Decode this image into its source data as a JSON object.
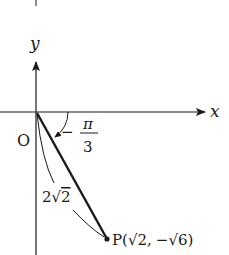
{
  "diagram": {
    "type": "coordinate-plane",
    "axes": {
      "x_label": "x",
      "y_label": "y"
    },
    "origin_label": "O",
    "angle": {
      "minus": "−",
      "numerator": "π",
      "denominator": "3",
      "text": "−π/3"
    },
    "segment_length": {
      "coef": "2",
      "radical": "√",
      "radicand": "2",
      "text": "2√2"
    },
    "point": {
      "name": "P",
      "open": "(",
      "x_text": "√2",
      "sep": ",",
      "y_text": "−√6",
      "close": ")",
      "full": "P(√2, −√6)"
    },
    "colors": {
      "stroke": "#1a1a1a",
      "background": "#ffffff"
    }
  }
}
